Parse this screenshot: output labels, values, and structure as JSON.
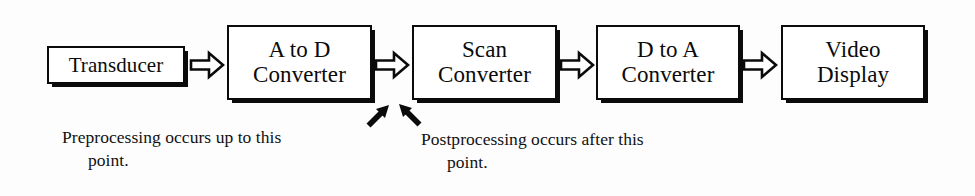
{
  "diagram": {
    "type": "block-flow-diagram",
    "background_color": "#fdfdfd",
    "stroke_color": "#0b0b0b",
    "nodes": [
      {
        "id": "transducer",
        "lines": [
          "Transducer"
        ]
      },
      {
        "id": "adc",
        "lines": [
          "A to D",
          "Converter"
        ]
      },
      {
        "id": "scan",
        "lines": [
          "Scan",
          "Converter"
        ]
      },
      {
        "id": "dac",
        "lines": [
          "D to A",
          "Converter"
        ]
      },
      {
        "id": "video",
        "lines": [
          "Video",
          "Display"
        ]
      }
    ],
    "connectors": [
      {
        "id": "connector-1",
        "icon": "block-arrow-right-icon",
        "from": "transducer",
        "to": "adc"
      },
      {
        "id": "connector-2",
        "icon": "block-arrow-right-icon",
        "from": "adc",
        "to": "scan"
      },
      {
        "id": "connector-3",
        "icon": "block-arrow-right-icon",
        "from": "scan",
        "to": "dac"
      },
      {
        "id": "connector-4",
        "icon": "block-arrow-right-icon",
        "from": "dac",
        "to": "video"
      }
    ],
    "annotation_arrows": [
      {
        "id": "arrow-preprocessing",
        "icon": "arrow-up-right-icon",
        "points_to": "adc"
      },
      {
        "id": "arrow-postprocessing",
        "icon": "arrow-up-left-icon",
        "points_to": "scan"
      }
    ],
    "captions": {
      "preprocessing": {
        "line1": "Preprocessing occurs up to this",
        "line2": "point."
      },
      "postprocessing": {
        "line1": "Postprocessing occurs after this",
        "line2": "point."
      }
    }
  }
}
